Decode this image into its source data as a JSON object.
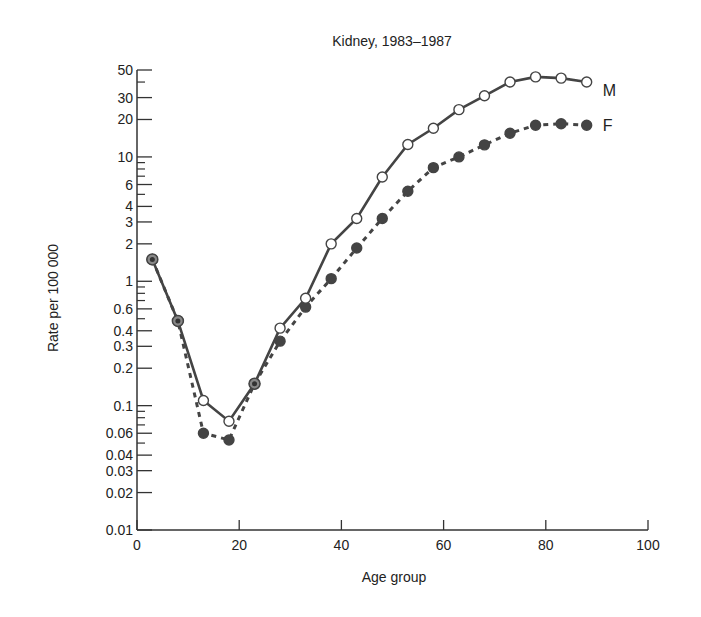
{
  "chart_data": {
    "type": "line",
    "title": "Kidney, 1983–1987",
    "xlabel": "Age group",
    "ylabel": "Rate per 100 000",
    "xlim": [
      0,
      100
    ],
    "ylim": [
      0.01,
      50
    ],
    "yscale": "log",
    "x_ticks": [
      0,
      20,
      40,
      60,
      80,
      100
    ],
    "y_tick_labels": [
      "0.01",
      "0.02",
      "0.03",
      "0.04",
      "0.06",
      "0.1",
      "0.2",
      "0.3",
      "0.4",
      "0.6",
      "1",
      "2",
      "3",
      "4",
      "6",
      "10",
      "20",
      "30",
      "50"
    ],
    "grid": false,
    "legend_position": "inline-right",
    "x": [
      3,
      8,
      13,
      18,
      23,
      28,
      33,
      38,
      43,
      48,
      53,
      58,
      63,
      68,
      73,
      78,
      83,
      88
    ],
    "series": [
      {
        "name": "M",
        "style": "solid, open circles",
        "values": [
          1.5,
          0.48,
          0.11,
          0.075,
          0.15,
          0.42,
          0.73,
          2.0,
          3.2,
          6.9,
          12.6,
          17,
          24,
          31,
          40,
          44,
          43,
          40
        ]
      },
      {
        "name": "F",
        "style": "dashed, filled circles",
        "values": [
          1.5,
          0.48,
          0.06,
          0.053,
          0.15,
          0.33,
          0.62,
          1.05,
          1.85,
          3.2,
          5.3,
          8.2,
          10,
          12.5,
          15.5,
          18,
          18.5,
          18
        ]
      }
    ]
  }
}
